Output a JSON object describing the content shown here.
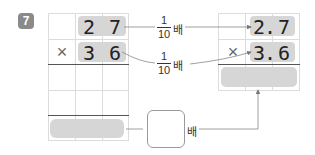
{
  "problem": {
    "number": "7",
    "left_grid": {
      "row1": [
        "",
        "2",
        "7"
      ],
      "row2": [
        "×",
        "3",
        "6"
      ]
    },
    "right_grid": {
      "row1": [
        "",
        "2",
        ".",
        "7"
      ],
      "row2": [
        "×",
        "3",
        ".",
        "6"
      ]
    },
    "arrow_labels": [
      {
        "numerator": "1",
        "denominator": "10",
        "suffix": "배"
      },
      {
        "numerator": "1",
        "denominator": "10",
        "suffix": "배"
      }
    ],
    "answer_box": {
      "value": "",
      "suffix": "배"
    }
  },
  "colors": {
    "highlight": "#d6d6d6",
    "grid_line": "#dcdcdc",
    "badge": "#8a8a8a"
  }
}
